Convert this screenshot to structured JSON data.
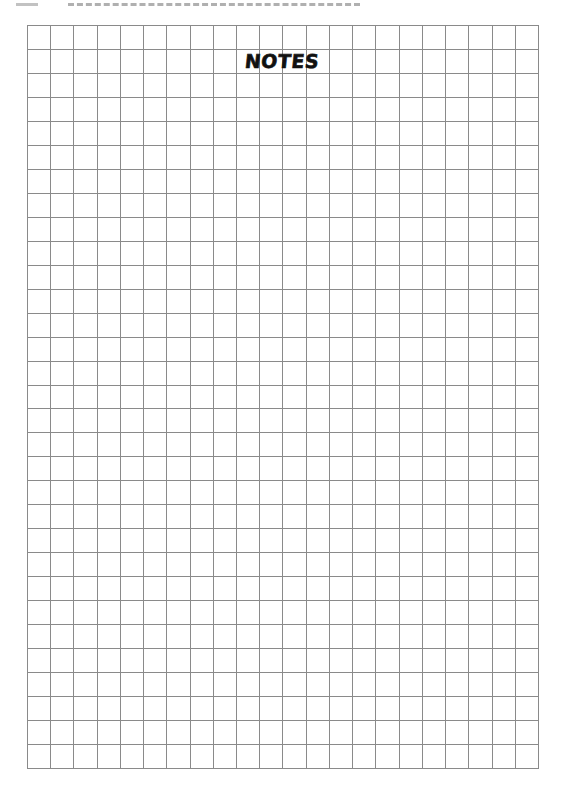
{
  "page": {
    "background": "#ffffff",
    "running_header": {
      "visible": true,
      "clipped": true,
      "note": "illegible"
    }
  },
  "notes_sheet": {
    "title": "NOTES",
    "grid": {
      "columns": 22,
      "rows": 31,
      "line_color": "#8a8a8a",
      "cell_width_px": 23.3,
      "cell_height_px": 24
    }
  }
}
